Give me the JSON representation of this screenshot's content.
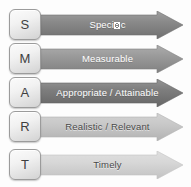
{
  "diagram": {
    "background_color": "#fdfdfd",
    "rows": [
      {
        "letter": "S",
        "label": "Specific",
        "label_prefix": "Speci",
        "label_suffix": "c",
        "has_missing_glyph": true,
        "missing_glyph_note": "fi ligature renders as a missing-character box",
        "arrow_color": "#8a8a8a",
        "arrow_edge_color": "#6f6f6f",
        "text_color": "#ffffff",
        "text_on_dark": true,
        "top": 8
      },
      {
        "letter": "M",
        "label": "Measurable",
        "label_prefix": "Measurable",
        "label_suffix": "",
        "has_missing_glyph": false,
        "arrow_color": "#9b9b9b",
        "arrow_edge_color": "#818181",
        "text_color": "#ffffff",
        "text_on_dark": true,
        "top": 42
      },
      {
        "letter": "A",
        "label": "Appropriate / Attainable",
        "label_prefix": "Appropriate / Attainable",
        "label_suffix": "",
        "has_missing_glyph": false,
        "arrow_color": "#7e7e7e",
        "arrow_edge_color": "#666666",
        "text_color": "#ffffff",
        "text_on_dark": true,
        "top": 76
      },
      {
        "letter": "R",
        "label": "Realistic / Relevant",
        "label_prefix": "Realistic / Relevant",
        "label_suffix": "",
        "has_missing_glyph": false,
        "arrow_color": "#c9c9c9",
        "arrow_edge_color": "#b2b2b2",
        "text_color": "#4a4a4a",
        "text_on_dark": false,
        "top": 110
      },
      {
        "letter": "T",
        "label": "Timely",
        "label_prefix": "Timely",
        "label_suffix": "",
        "has_missing_glyph": false,
        "arrow_color": "#d8d8d8",
        "arrow_edge_color": "#c2c2c2",
        "text_color": "#4a4a4a",
        "text_on_dark": false,
        "top": 148
      }
    ],
    "tile_style": {
      "border_color": "#9b9b9b",
      "text_color": "#3f3f3f"
    }
  }
}
